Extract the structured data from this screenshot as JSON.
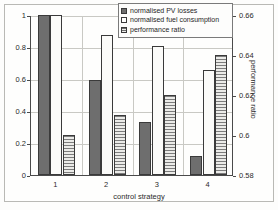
{
  "chart_data": {
    "type": "bar",
    "title": "",
    "xlabel": "control strategy",
    "ylabel": "",
    "ylabel_right": "performance ratio",
    "categories": [
      "1",
      "2",
      "3",
      "4"
    ],
    "ylim": [
      0,
      1
    ],
    "yticks": [
      "0",
      "0.2",
      "0.4",
      "0.6",
      "0.8",
      "1"
    ],
    "ylim_right": [
      0.58,
      0.66
    ],
    "yticks_right": [
      "0.58",
      "0.6",
      "0.62",
      "0.64",
      "0.66"
    ],
    "grid": true,
    "legend_position": "top-right",
    "series": [
      {
        "name": "normalised PV losses",
        "axis": "left",
        "style": "solid-dark-gray",
        "color": "#6e6e6e",
        "values": [
          1.0,
          0.595,
          0.33,
          0.12
        ]
      },
      {
        "name": "normalised fuel consumption",
        "axis": "left",
        "style": "white",
        "color": "#ffffff",
        "values": [
          1.0,
          0.875,
          0.805,
          0.655
        ]
      },
      {
        "name": "performance ratio",
        "axis": "right",
        "style": "horizontal-stripes",
        "color": "#7c7c7c",
        "values": [
          0.6,
          0.61,
          0.62,
          0.64
        ],
        "values_left_scale": [
          0.25,
          0.375,
          0.5,
          0.75
        ]
      }
    ]
  },
  "legend": {
    "items": [
      {
        "label": "normalised PV losses"
      },
      {
        "label": "normalised fuel consumption"
      },
      {
        "label": "performance ratio"
      }
    ]
  },
  "axes": {
    "x_title": "control strategy",
    "y_right_title": "performance ratio"
  }
}
